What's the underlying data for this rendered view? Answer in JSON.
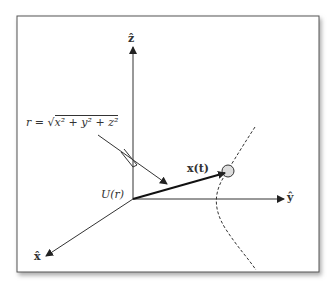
{
  "diagram": {
    "axes": {
      "z_label": "ẑ",
      "y_label": "ŷ",
      "x_label": "x̂"
    },
    "labels": {
      "radius_eq_lhs": "r =",
      "radius_eq_rhs": "x² + y² + z²",
      "potential": "U(r)",
      "position": "x(t)"
    },
    "colors": {
      "line": "#222222",
      "frame": "#555555",
      "particle_fill": "#dddddd"
    }
  }
}
